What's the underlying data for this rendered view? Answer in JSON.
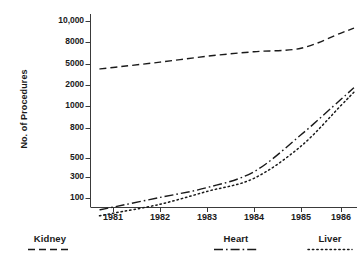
{
  "chart_data": {
    "type": "line",
    "title": "",
    "xlabel": "",
    "ylabel": "No. of Procedures",
    "grid": false,
    "legend_position": "below-axis",
    "x": [
      1981,
      1982,
      1983,
      1984,
      1985,
      1986
    ],
    "xtick_labels": [
      "1981",
      "1982",
      "1983",
      "1984",
      "1985",
      "1986"
    ],
    "ytick_labels": [
      "10,000",
      "8000",
      "5000",
      "2000",
      "1000",
      "800",
      "500",
      "300",
      "100"
    ],
    "ytick_values": [
      10000,
      8000,
      5000,
      2000,
      1000,
      800,
      500,
      300,
      100
    ],
    "yscale": "log-compressed",
    "ylim": [
      40,
      11000
    ],
    "series": [
      {
        "name": "Kidney",
        "linestyle": "dashed",
        "values": [
          4300,
          5200,
          5900,
          6500,
          7000,
          8800
        ],
        "color": "#1a1a1a"
      },
      {
        "name": "Heart",
        "linestyle": "dash-dot",
        "values": [
          62,
          103,
          172,
          346,
          719,
          1250
        ],
        "color": "#1a1a1a"
      },
      {
        "name": "Liver",
        "linestyle": "dotted",
        "values": [
          45,
          72,
          141,
          280,
          602,
          1020
        ],
        "color": "#1a1a1a"
      }
    ]
  },
  "legend": [
    {
      "label": "Kidney",
      "linestyle": "dashed"
    },
    {
      "label": "Heart",
      "linestyle": "dash-dot"
    },
    {
      "label": "Liver",
      "linestyle": "dotted"
    }
  ]
}
